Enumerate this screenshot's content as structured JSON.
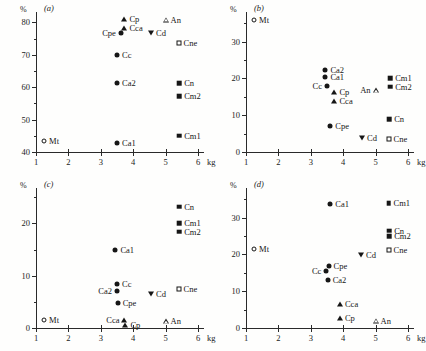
{
  "figure": {
    "axis_unit_y": "%",
    "axis_unit_x": "kg",
    "panels": [
      "(a)",
      "(b)",
      "(c)",
      "(d)"
    ]
  },
  "chart_data": [
    {
      "type": "scatter",
      "title": "(a)",
      "xlabel": "kg",
      "ylabel": "%",
      "xlim": [
        1,
        6
      ],
      "ylim": [
        40,
        82
      ],
      "xticks": [
        1,
        2,
        3,
        4,
        5,
        6
      ],
      "yticks": [
        40,
        50,
        60,
        70,
        80
      ],
      "yminor": [
        45,
        55,
        65,
        75
      ],
      "grid": false,
      "legend": "none",
      "points": [
        {
          "label": "Mt",
          "x": 1.25,
          "y": 43.5,
          "marker": "open-circle",
          "lab_pos": "right"
        },
        {
          "label": "Ca1",
          "x": 3.5,
          "y": 42.8,
          "marker": "filled-circle",
          "lab_pos": "right"
        },
        {
          "label": "Ca2",
          "x": 3.5,
          "y": 61.3,
          "marker": "filled-circle",
          "lab_pos": "right"
        },
        {
          "label": "Cc",
          "x": 3.5,
          "y": 70.0,
          "marker": "filled-circle",
          "lab_pos": "right"
        },
        {
          "label": "Cpe",
          "x": 3.62,
          "y": 76.8,
          "marker": "filled-circle",
          "lab_pos": "left"
        },
        {
          "label": "Cca",
          "x": 3.73,
          "y": 78.2,
          "marker": "filled-triangle",
          "lab_pos": "right"
        },
        {
          "label": "Cp",
          "x": 3.73,
          "y": 81.0,
          "marker": "filled-triangle",
          "lab_pos": "right"
        },
        {
          "label": "Cd",
          "x": 4.55,
          "y": 76.6,
          "marker": "filled-dtriangle",
          "lab_pos": "right"
        },
        {
          "label": "An",
          "x": 5.0,
          "y": 80.8,
          "marker": "open-triangle",
          "lab_pos": "right"
        },
        {
          "label": "Cne",
          "x": 5.4,
          "y": 73.8,
          "marker": "open-square",
          "lab_pos": "right"
        },
        {
          "label": "Cn",
          "x": 5.42,
          "y": 61.3,
          "marker": "filled-square",
          "lab_pos": "right"
        },
        {
          "label": "Cm2",
          "x": 5.42,
          "y": 57.2,
          "marker": "filled-square",
          "lab_pos": "right"
        },
        {
          "label": "Cm1",
          "x": 5.42,
          "y": 45.0,
          "marker": "filled-square",
          "lab_pos": "right"
        }
      ]
    },
    {
      "type": "scatter",
      "title": "(b)",
      "xlabel": "kg",
      "ylabel": "%",
      "xlim": [
        1,
        6
      ],
      "ylim": [
        0,
        37
      ],
      "xticks": [
        1,
        2,
        3,
        4,
        5,
        6
      ],
      "yticks": [
        0,
        10,
        20,
        30
      ],
      "yminor": [
        5,
        15,
        25,
        35
      ],
      "grid": false,
      "legend": "none",
      "points": [
        {
          "label": "Mt",
          "x": 1.25,
          "y": 35.8,
          "marker": "open-circle",
          "lab_pos": "right"
        },
        {
          "label": "Ca2",
          "x": 3.45,
          "y": 22.2,
          "marker": "filled-circle",
          "lab_pos": "right"
        },
        {
          "label": "Ca1",
          "x": 3.45,
          "y": 20.5,
          "marker": "filled-circle",
          "lab_pos": "right"
        },
        {
          "label": "Cc",
          "x": 3.5,
          "y": 18.0,
          "marker": "filled-circle",
          "lab_pos": "left"
        },
        {
          "label": "Cp",
          "x": 3.73,
          "y": 16.3,
          "marker": "filled-triangle",
          "lab_pos": "right"
        },
        {
          "label": "Cca",
          "x": 3.73,
          "y": 14.0,
          "marker": "filled-triangle",
          "lab_pos": "right"
        },
        {
          "label": "Cpe",
          "x": 3.6,
          "y": 7.0,
          "marker": "filled-circle",
          "lab_pos": "right"
        },
        {
          "label": "Cd",
          "x": 4.58,
          "y": 3.8,
          "marker": "filled-dtriangle",
          "lab_pos": "right"
        },
        {
          "label": "An",
          "x": 5.0,
          "y": 16.8,
          "marker": "open-triangle",
          "lab_pos": "left"
        },
        {
          "label": "Cm1",
          "x": 5.45,
          "y": 20.0,
          "marker": "filled-square",
          "lab_pos": "right"
        },
        {
          "label": "Cm2",
          "x": 5.45,
          "y": 17.8,
          "marker": "filled-square",
          "lab_pos": "right"
        },
        {
          "label": "Cn",
          "x": 5.42,
          "y": 9.0,
          "marker": "filled-square",
          "lab_pos": "right"
        },
        {
          "label": "Cne",
          "x": 5.4,
          "y": 3.5,
          "marker": "open-square",
          "lab_pos": "right"
        }
      ]
    },
    {
      "type": "scatter",
      "title": "(c)",
      "xlabel": "kg",
      "ylabel": "%",
      "xlim": [
        1,
        6
      ],
      "ylim": [
        0,
        26
      ],
      "xticks": [
        1,
        2,
        3,
        4,
        5,
        6
      ],
      "yticks": [
        0,
        10,
        20
      ],
      "yminor": [
        5,
        15,
        25
      ],
      "grid": false,
      "legend": "none",
      "points": [
        {
          "label": "Mt",
          "x": 1.25,
          "y": 1.5,
          "marker": "open-circle",
          "lab_pos": "right"
        },
        {
          "label": "Cn",
          "x": 5.42,
          "y": 23.2,
          "marker": "filled-square",
          "lab_pos": "right"
        },
        {
          "label": "Cm1",
          "x": 5.42,
          "y": 20.0,
          "marker": "filled-square",
          "lab_pos": "right"
        },
        {
          "label": "Cm2",
          "x": 5.42,
          "y": 18.4,
          "marker": "filled-square",
          "lab_pos": "right"
        },
        {
          "label": "Ca1",
          "x": 3.45,
          "y": 15.0,
          "marker": "filled-circle",
          "lab_pos": "right"
        },
        {
          "label": "Cc",
          "x": 3.5,
          "y": 8.5,
          "marker": "filled-circle",
          "lab_pos": "right"
        },
        {
          "label": "Ca2",
          "x": 3.5,
          "y": 7.0,
          "marker": "filled-circle",
          "lab_pos": "left"
        },
        {
          "label": "Cpe",
          "x": 3.52,
          "y": 4.8,
          "marker": "filled-circle",
          "lab_pos": "right"
        },
        {
          "label": "Cd",
          "x": 4.55,
          "y": 6.5,
          "marker": "filled-dtriangle",
          "lab_pos": "right"
        },
        {
          "label": "Cne",
          "x": 5.4,
          "y": 7.5,
          "marker": "open-square",
          "lab_pos": "right"
        },
        {
          "label": "Cca",
          "x": 3.73,
          "y": 1.5,
          "marker": "filled-triangle",
          "lab_pos": "left"
        },
        {
          "label": "Cp",
          "x": 3.76,
          "y": 0.6,
          "marker": "filled-triangle",
          "lab_pos": "right"
        },
        {
          "label": "An",
          "x": 5.0,
          "y": 1.3,
          "marker": "open-triangle",
          "lab_pos": "right"
        }
      ]
    },
    {
      "type": "scatter",
      "title": "(d)",
      "xlabel": "kg",
      "ylabel": "%",
      "xlim": [
        1,
        6
      ],
      "ylim": [
        0,
        37
      ],
      "xticks": [
        1,
        2,
        3,
        4,
        5,
        6
      ],
      "yticks": [
        0,
        10,
        20,
        30
      ],
      "yminor": [
        5,
        15,
        25,
        35
      ],
      "grid": false,
      "legend": "none",
      "points": [
        {
          "label": "Ca1",
          "x": 3.6,
          "y": 33.8,
          "marker": "filled-circle",
          "lab_pos": "right"
        },
        {
          "label": "Cm1",
          "x": 5.4,
          "y": 34.0,
          "marker": "filled-square",
          "lab_pos": "right"
        },
        {
          "label": "Cn",
          "x": 5.42,
          "y": 26.5,
          "marker": "filled-square",
          "lab_pos": "right"
        },
        {
          "label": "Cm2",
          "x": 5.42,
          "y": 25.0,
          "marker": "filled-square",
          "lab_pos": "right"
        },
        {
          "label": "Cne",
          "x": 5.4,
          "y": 21.2,
          "marker": "open-square",
          "lab_pos": "right"
        },
        {
          "label": "Mt",
          "x": 1.25,
          "y": 21.5,
          "marker": "open-circle",
          "lab_pos": "right"
        },
        {
          "label": "Cd",
          "x": 4.55,
          "y": 19.8,
          "marker": "filled-dtriangle",
          "lab_pos": "right"
        },
        {
          "label": "Cpe",
          "x": 3.55,
          "y": 17.0,
          "marker": "filled-circle",
          "lab_pos": "right"
        },
        {
          "label": "Cc",
          "x": 3.48,
          "y": 15.5,
          "marker": "filled-circle",
          "lab_pos": "left"
        },
        {
          "label": "Ca2",
          "x": 3.52,
          "y": 13.0,
          "marker": "filled-circle",
          "lab_pos": "right"
        },
        {
          "label": "Cca",
          "x": 3.9,
          "y": 6.5,
          "marker": "filled-triangle",
          "lab_pos": "right"
        },
        {
          "label": "Cp",
          "x": 3.9,
          "y": 2.8,
          "marker": "filled-triangle",
          "lab_pos": "right"
        },
        {
          "label": "An",
          "x": 5.0,
          "y": 2.0,
          "marker": "open-triangle",
          "lab_pos": "right"
        }
      ]
    }
  ]
}
